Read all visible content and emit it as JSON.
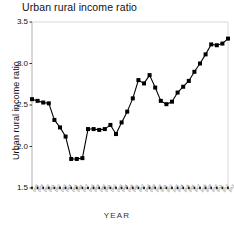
{
  "chart_data": {
    "type": "line",
    "title": "Urban rural income ratio",
    "xlabel": "YEAR",
    "ylabel": "Urban rural income ratio",
    "ylim": [
      1.5,
      3.5
    ],
    "ytick_labels": [
      "3.5",
      "3.0",
      "2.5",
      "2.0",
      "1.5"
    ],
    "ytick_values": [
      3.5,
      3.0,
      2.5,
      2.0,
      1.5
    ],
    "grid": false,
    "legend": "none",
    "marker": "filled-square",
    "line_color": "#000000",
    "marker_color": "#000000",
    "axis_color": "#b0b0b0",
    "categories": [
      "1978",
      "1979",
      "1980",
      "1981",
      "1982",
      "1983",
      "1984",
      "1985",
      "1986",
      "1987",
      "1988",
      "1989",
      "1990",
      "1991",
      "1992",
      "1993",
      "1994",
      "1995",
      "1996",
      "1997",
      "1998",
      "1999",
      "2000",
      "2001",
      "2002",
      "2003",
      "2004",
      "2005",
      "2006",
      "2007",
      "2008",
      "2009",
      "2010",
      "2011",
      "2012",
      "2013",
      "2014",
      "2015",
      "2016",
      "2017"
    ],
    "values": [
      2.57,
      2.53,
      2.52,
      2.32,
      2.12,
      1.85,
      1.85,
      1.86,
      2.21,
      2.21,
      2.2,
      2.29,
      2.2,
      2.4,
      2.58,
      2.8,
      2.86,
      2.71,
      2.51,
      2.47,
      2.52,
      2.65,
      2.79,
      2.9,
      3.11,
      3.23,
      3.22,
      3.3,
      2.2,
      2.2,
      2.2,
      2.2,
      2.2,
      2.2,
      2.2,
      2.2,
      2.2,
      2.2,
      2.2,
      2.2
    ],
    "series": [
      {
        "name": "Urban rural income ratio",
        "points": [
          {
            "x": "1978",
            "y": 2.57
          },
          {
            "x": "1979",
            "y": 2.55
          },
          {
            "x": "1980",
            "y": 2.53
          },
          {
            "x": "1981",
            "y": 2.52
          },
          {
            "x": "1982",
            "y": 2.32
          },
          {
            "x": "1983",
            "y": 2.23
          },
          {
            "x": "1984",
            "y": 2.12
          },
          {
            "x": "1985",
            "y": 1.85
          },
          {
            "x": "1986",
            "y": 1.85
          },
          {
            "x": "1987",
            "y": 1.86
          },
          {
            "x": "1988",
            "y": 2.21
          },
          {
            "x": "1989",
            "y": 2.21
          },
          {
            "x": "1990",
            "y": 2.2
          },
          {
            "x": "1991",
            "y": 2.21
          },
          {
            "x": "1992",
            "y": 2.26
          },
          {
            "x": "1993",
            "y": 2.15
          },
          {
            "x": "1994",
            "y": 2.29
          },
          {
            "x": "1995",
            "y": 2.42
          },
          {
            "x": "1996",
            "y": 2.58
          },
          {
            "x": "1997",
            "y": 2.8
          },
          {
            "x": "1998",
            "y": 2.76
          },
          {
            "x": "1999",
            "y": 2.86
          },
          {
            "x": "2000",
            "y": 2.71
          },
          {
            "x": "2001",
            "y": 2.55
          },
          {
            "x": "2002",
            "y": 2.51
          },
          {
            "x": "2003",
            "y": 2.54
          },
          {
            "x": "2004",
            "y": 2.65
          },
          {
            "x": "2005",
            "y": 2.72
          },
          {
            "x": "2006",
            "y": 2.79
          },
          {
            "x": "2007",
            "y": 2.9
          },
          {
            "x": "2008",
            "y": 3.0
          },
          {
            "x": "2009",
            "y": 3.11
          },
          {
            "x": "2010",
            "y": 3.23
          },
          {
            "x": "2011",
            "y": 3.22
          },
          {
            "x": "2012",
            "y": 3.24
          },
          {
            "x": "2013",
            "y": 3.3
          }
        ]
      }
    ],
    "annotations": []
  }
}
